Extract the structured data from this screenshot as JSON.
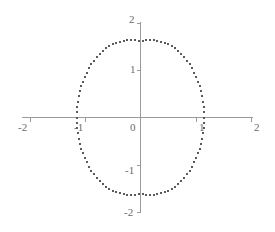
{
  "chart_data": {
    "type": "scatter",
    "title": "",
    "subtitle": "",
    "xlabel": "",
    "ylabel": "",
    "xlim": [
      -2,
      2
    ],
    "ylim": [
      -2,
      2
    ],
    "grid": false,
    "legend": null,
    "annotations": [],
    "marker": {
      "shape": "square",
      "size_px": 2,
      "color": "#5a5a5a"
    },
    "axis_color": "#9a9a9a",
    "ellipse": {
      "center": [
        0,
        0
      ],
      "semi_axis_x": 1.15,
      "semi_axis_y": 1.8,
      "n_points": 100
    },
    "xticks": [
      -2,
      -1,
      0,
      1,
      2
    ],
    "xtick_labels": [
      "-2",
      "-1",
      "0",
      "1",
      "2"
    ],
    "yticks": [
      -2,
      -1,
      1,
      2
    ],
    "ytick_labels": [
      "-2",
      "-1",
      "1",
      "2"
    ],
    "x": [
      1.15,
      1.1477,
      1.1409,
      1.1297,
      1.114,
      1.094,
      1.0697,
      1.0412,
      1.0087,
      0.9723,
      0.9321,
      0.8883,
      0.8412,
      0.7909,
      0.7377,
      0.6818,
      0.6234,
      0.5629,
      0.5005,
      0.4364,
      0.3711,
      0.3047,
      0.2376,
      0.1701,
      0.1025,
      0.0361,
      -0.0361,
      -0.1025,
      -0.1701,
      -0.2376,
      -0.3047,
      -0.3711,
      -0.4364,
      -0.5005,
      -0.5629,
      -0.6234,
      -0.6818,
      -0.7377,
      -0.7909,
      -0.8412,
      -0.8883,
      -0.9321,
      -0.9723,
      -1.0087,
      -1.0412,
      -1.0697,
      -1.094,
      -1.114,
      -1.1297,
      -1.1409,
      -1.1477,
      -1.15,
      -1.1477,
      -1.1409,
      -1.1297,
      -1.114,
      -1.094,
      -1.0697,
      -1.0412,
      -1.0087,
      -0.9723,
      -0.9321,
      -0.8883,
      -0.8412,
      -0.7909,
      -0.7377,
      -0.6818,
      -0.6234,
      -0.5629,
      -0.5005,
      -0.4364,
      -0.3711,
      -0.3047,
      -0.2376,
      -0.1701,
      -0.1025,
      -0.0361,
      0.0361,
      0.1025,
      0.1701,
      0.2376,
      0.3047,
      0.3711,
      0.4364,
      0.5005,
      0.5629,
      0.6234,
      0.6818,
      0.7377,
      0.7909,
      0.8412,
      0.8883,
      0.9321,
      0.9723,
      1.0087,
      1.0412,
      1.0697,
      1.094,
      1.114,
      1.1297,
      1.1409,
      1.1477
    ],
    "y": [
      0.0,
      0.113,
      0.2256,
      0.3371,
      0.4472,
      0.5551,
      0.6604,
      0.7627,
      0.8613,
      0.9559,
      1.046,
      1.1311,
      1.2108,
      1.2848,
      1.3526,
      1.414,
      1.4686,
      1.5162,
      1.5565,
      1.5893,
      1.6145,
      1.6319,
      1.6415,
      1.6432,
      1.637,
      1.623,
      1.623,
      1.637,
      1.6432,
      1.6415,
      1.6319,
      1.6145,
      1.5893,
      1.5565,
      1.5162,
      1.4686,
      1.414,
      1.3526,
      1.2848,
      1.2108,
      1.1311,
      1.046,
      0.9559,
      0.8613,
      0.7627,
      0.6604,
      0.5551,
      0.4472,
      0.3371,
      0.2256,
      0.113,
      0.0,
      -0.113,
      -0.2256,
      -0.3371,
      -0.4472,
      -0.5551,
      -0.6604,
      -0.7627,
      -0.8613,
      -0.9559,
      -1.046,
      -1.1311,
      -1.2108,
      -1.2848,
      -1.3526,
      -1.414,
      -1.4686,
      -1.5162,
      -1.5565,
      -1.5893,
      -1.6145,
      -1.6319,
      -1.6415,
      -1.6432,
      -1.637,
      -1.623,
      -1.623,
      -1.637,
      -1.6432,
      -1.6415,
      -1.6319,
      -1.6145,
      -1.5893,
      -1.5565,
      -1.5162,
      -1.4686,
      -1.414,
      -1.3526,
      -1.2848,
      -1.2108,
      -1.1311,
      -1.046,
      -0.9559,
      -0.8613,
      -0.7627,
      -0.6604,
      -0.5551,
      -0.4472,
      -0.3371,
      -0.2256,
      -0.113
    ]
  },
  "labels": {
    "x_neg2": "-2",
    "x_neg1": "-1",
    "origin": "0",
    "x_pos1": "1",
    "x_pos2": "2",
    "y_neg2": "-2",
    "y_neg1": "-1",
    "y_pos1": "1",
    "y_pos2": "2"
  }
}
